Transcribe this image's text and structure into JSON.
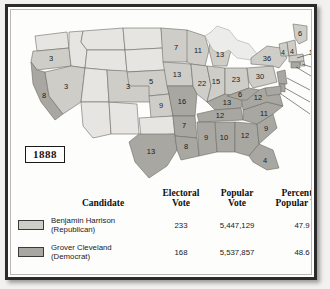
{
  "figure": {
    "year_label": "1888"
  },
  "colors": {
    "republican_fill": "#cfcdc8",
    "democrat_fill": "#a9a7a1",
    "non_state_fill": "#e6e5e2",
    "state_border": "#6d6b66",
    "outline": "#2b2b2b",
    "paper": "#fdfdfc"
  },
  "map": {
    "states": [
      {
        "name": "washington",
        "votes": "",
        "party": "none"
      },
      {
        "name": "oregon",
        "votes": "3",
        "party": "republican"
      },
      {
        "name": "california",
        "votes": "8",
        "party": "democrat"
      },
      {
        "name": "nevada",
        "votes": "3",
        "party": "republican"
      },
      {
        "name": "idaho",
        "votes": "",
        "party": "none"
      },
      {
        "name": "montana",
        "votes": "",
        "party": "none"
      },
      {
        "name": "wyoming",
        "votes": "",
        "party": "none"
      },
      {
        "name": "utah",
        "votes": "",
        "party": "none"
      },
      {
        "name": "arizona",
        "votes": "",
        "party": "none"
      },
      {
        "name": "new-mexico",
        "votes": "",
        "party": "none"
      },
      {
        "name": "colorado",
        "votes": "3",
        "party": "republican"
      },
      {
        "name": "north-dakota",
        "votes": "",
        "party": "none"
      },
      {
        "name": "south-dakota",
        "votes": "",
        "party": "none"
      },
      {
        "name": "nebraska",
        "votes": "5",
        "party": "republican"
      },
      {
        "name": "kansas",
        "votes": "9",
        "party": "republican"
      },
      {
        "name": "oklahoma",
        "votes": "",
        "party": "none"
      },
      {
        "name": "texas",
        "votes": "13",
        "party": "democrat"
      },
      {
        "name": "minnesota",
        "votes": "7",
        "party": "republican"
      },
      {
        "name": "iowa",
        "votes": "13",
        "party": "republican"
      },
      {
        "name": "missouri",
        "votes": "16",
        "party": "democrat"
      },
      {
        "name": "arkansas",
        "votes": "7",
        "party": "democrat"
      },
      {
        "name": "louisiana",
        "votes": "8",
        "party": "democrat"
      },
      {
        "name": "wisconsin",
        "votes": "11",
        "party": "republican"
      },
      {
        "name": "illinois",
        "votes": "22",
        "party": "republican"
      },
      {
        "name": "michigan",
        "votes": "13",
        "party": "republican"
      },
      {
        "name": "indiana",
        "votes": "15",
        "party": "republican"
      },
      {
        "name": "ohio",
        "votes": "23",
        "party": "republican"
      },
      {
        "name": "kentucky",
        "votes": "13",
        "party": "democrat"
      },
      {
        "name": "tennessee",
        "votes": "12",
        "party": "democrat"
      },
      {
        "name": "mississippi",
        "votes": "9",
        "party": "democrat"
      },
      {
        "name": "alabama",
        "votes": "10",
        "party": "democrat"
      },
      {
        "name": "georgia",
        "votes": "12",
        "party": "democrat"
      },
      {
        "name": "florida",
        "votes": "4",
        "party": "democrat"
      },
      {
        "name": "south-carolina",
        "votes": "9",
        "party": "democrat"
      },
      {
        "name": "north-carolina",
        "votes": "11",
        "party": "democrat"
      },
      {
        "name": "virginia",
        "votes": "12",
        "party": "democrat"
      },
      {
        "name": "west-virginia",
        "votes": "6",
        "party": "democrat"
      },
      {
        "name": "pennsylvania",
        "votes": "30",
        "party": "republican"
      },
      {
        "name": "new-york",
        "votes": "36",
        "party": "republican"
      },
      {
        "name": "vermont",
        "votes": "4",
        "party": "republican"
      },
      {
        "name": "new-hampshire",
        "votes": "4",
        "party": "republican"
      },
      {
        "name": "maine",
        "votes": "6",
        "party": "republican"
      }
    ],
    "callouts": [
      {
        "name": "massachusetts",
        "votes": "14",
        "party": "republican"
      },
      {
        "name": "rhode-island",
        "votes": "4",
        "party": "republican"
      },
      {
        "name": "connecticut",
        "votes": "6",
        "party": "democrat"
      },
      {
        "name": "new-jersey",
        "votes": "9",
        "party": "democrat"
      },
      {
        "name": "delaware",
        "votes": "3",
        "party": "democrat"
      },
      {
        "name": "maryland",
        "votes": "8",
        "party": "democrat"
      }
    ]
  },
  "table": {
    "headers": {
      "swatch": "",
      "candidate": "Candidate",
      "electoral_vote_line1": "Electoral",
      "electoral_vote_line2": "Vote",
      "popular_vote_line1": "Popular",
      "popular_vote_line2": "Vote",
      "percent_line1": "Percent of",
      "percent_line2": "Popular Vote"
    },
    "rows": [
      {
        "name_line1": "Benjamin Harrison",
        "name_line2": "(Republican)",
        "electoral_vote": "233",
        "popular_vote": "5,447,129",
        "percent": "47.9",
        "swatch_color": "#cfcdc8"
      },
      {
        "name_line1": "Grover Cleveland",
        "name_line2": "(Democrat)",
        "electoral_vote": "168",
        "popular_vote": "5,537,857",
        "percent": "48.6",
        "swatch_color": "#a9a7a1"
      }
    ]
  }
}
